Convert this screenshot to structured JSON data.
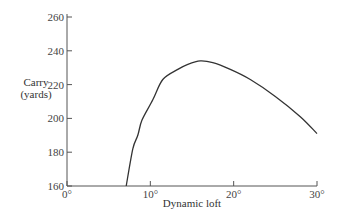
{
  "chart_data": {
    "type": "line",
    "title": "",
    "xlabel": "Dynamic loft",
    "ylabel": "Carry (yards)",
    "ylabel_lines": [
      "Carry",
      "(yards)"
    ],
    "xlim": [
      0,
      30
    ],
    "ylim": [
      160,
      260
    ],
    "x_ticks": [
      0,
      10,
      20,
      30
    ],
    "x_tick_labels": [
      "0°",
      "10°",
      "20°",
      "30°"
    ],
    "y_ticks": [
      160,
      180,
      200,
      220,
      240,
      260
    ],
    "y_tick_labels": [
      "160",
      "180",
      "200",
      "220",
      "240",
      "260"
    ],
    "grid": false,
    "legend": null,
    "series": [
      {
        "name": "Carry vs dynamic loft",
        "x": [
          7.1,
          7.9,
          8.5,
          9.0,
          10.3,
          11.5,
          13.3,
          14.5,
          16.0,
          17.5,
          19.6,
          22.0,
          25.0,
          28.0,
          30.0
        ],
        "y": [
          160,
          182,
          190,
          199,
          211,
          223,
          229,
          232,
          234,
          233,
          229,
          223,
          213,
          201,
          191
        ]
      }
    ],
    "colors": {
      "line": "#333333",
      "axis": "#555555"
    }
  }
}
